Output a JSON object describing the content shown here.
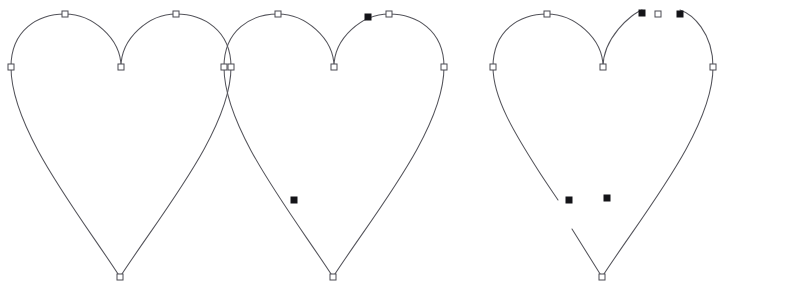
{
  "canvas": {
    "width": 810,
    "height": 288,
    "background_color": "#ffffff",
    "stroke_color": "#55555c",
    "stroke_width": 1.05,
    "node_hollow_fill": "#ffffff",
    "node_hollow_stroke": "#4a4a52",
    "node_filled_fill": "#141418",
    "node_size_hollow": 6,
    "node_size_filled": 6
  },
  "figure": {
    "type": "vector-path-editor-illustration",
    "panel_count": 3,
    "description_of_sequence": "intact path, path with two cut-point markers, path split into open subpaths at those markers"
  },
  "geometry": {
    "path_d": "M 11 67 C 11 30 38 14 65 14 C 92 14 121 38 121 67 C 121 38 149 14 176 14 C 203 14 231 30 231 67 C 231 130 160 215 120 277 C 80 215 11 130 11 67 Z",
    "segment_a_d": "M 11 67 C 11 30 38 14 65 14 C 92 14 121 38 121 67 C 121 38 149 14 160 10",
    "segment_b_d": "M 198 10 C 210 14 231 32 231 67 C 231 130 160 215 120 277 C 104 252 87 227 72 203",
    "segment_c_d": "M 11 67 C 11 30 38 14 65 14 C 92 14 121 38 121 67 C 121 38 149 14 160 10",
    "segment_d_d": "M 198 10 C 210 14 231 32 231 67 C 231 130 160 215 120 277 C 110 261 100 245 90 229",
    "segment_e_d": "M 11 67 C 11 98 33 134 56 170 C 63 181 70 191 76 200"
  },
  "panels": [
    {
      "id": "panel-1",
      "label": "original-path",
      "offset_x": 0,
      "offset_y": 0,
      "state": "closed-path-intact",
      "path_segments": [
        {
          "name": "full-heart-outline",
          "d_key": "path_d",
          "closed": true
        }
      ],
      "nodes": [
        {
          "name": "node-left",
          "x": 11,
          "y": 67,
          "type": "hollow"
        },
        {
          "name": "node-top-left",
          "x": 65,
          "y": 14,
          "type": "hollow"
        },
        {
          "name": "node-cleft",
          "x": 121,
          "y": 67,
          "type": "hollow"
        },
        {
          "name": "node-top-right",
          "x": 176,
          "y": 14,
          "type": "hollow"
        },
        {
          "name": "node-right",
          "x": 231,
          "y": 67,
          "type": "hollow"
        },
        {
          "name": "node-bottom",
          "x": 120,
          "y": 277,
          "type": "hollow"
        }
      ]
    },
    {
      "id": "panel-2",
      "label": "path-with-cut-markers",
      "offset_x": 213,
      "offset_y": 0,
      "state": "closed-path-with-two-selected-cut-points",
      "path_segments": [
        {
          "name": "full-heart-outline",
          "d_key": "path_d",
          "closed": true
        }
      ],
      "nodes": [
        {
          "name": "node-left",
          "x": 11,
          "y": 67,
          "type": "hollow"
        },
        {
          "name": "node-top-left",
          "x": 65,
          "y": 14,
          "type": "hollow"
        },
        {
          "name": "node-cleft",
          "x": 121,
          "y": 67,
          "type": "hollow"
        },
        {
          "name": "node-top-right",
          "x": 176,
          "y": 14,
          "type": "hollow"
        },
        {
          "name": "node-right",
          "x": 231,
          "y": 67,
          "type": "hollow"
        },
        {
          "name": "node-bottom",
          "x": 120,
          "y": 277,
          "type": "hollow"
        },
        {
          "name": "cut-marker-upper-right",
          "x": 155,
          "y": 17,
          "type": "filled"
        },
        {
          "name": "cut-marker-lower-left",
          "x": 81,
          "y": 200,
          "type": "filled"
        }
      ]
    },
    {
      "id": "panel-3",
      "label": "path-split-open-subpaths",
      "offset_x": 482,
      "offset_y": 0,
      "state": "open-subpaths-after-cut",
      "path_segments": [
        {
          "name": "subpath-left-lobe-and-inner-right-arc",
          "d_key": "segment_c_d",
          "closed": false
        },
        {
          "name": "subpath-right-lobe-and-right-flank",
          "d_key": "segment_d_d",
          "closed": false
        },
        {
          "name": "subpath-left-flank-stub",
          "d_key": "segment_e_d",
          "closed": false
        }
      ],
      "nodes": [
        {
          "name": "node-left",
          "x": 11,
          "y": 67,
          "type": "hollow"
        },
        {
          "name": "node-top-left",
          "x": 65,
          "y": 14,
          "type": "hollow"
        },
        {
          "name": "node-cleft",
          "x": 121,
          "y": 67,
          "type": "hollow"
        },
        {
          "name": "node-top-right",
          "x": 176,
          "y": 14,
          "type": "hollow"
        },
        {
          "name": "node-right",
          "x": 231,
          "y": 67,
          "type": "hollow"
        },
        {
          "name": "node-bottom",
          "x": 120,
          "y": 277,
          "type": "hollow"
        },
        {
          "name": "open-endpoint-upper-inner",
          "x": 160,
          "y": 13,
          "type": "filled"
        },
        {
          "name": "open-endpoint-upper-outer",
          "x": 198,
          "y": 14,
          "type": "filled"
        },
        {
          "name": "open-endpoint-lower-left",
          "x": 87,
          "y": 200,
          "type": "filled"
        },
        {
          "name": "open-endpoint-lower-right",
          "x": 125,
          "y": 198,
          "type": "filled"
        }
      ]
    }
  ]
}
